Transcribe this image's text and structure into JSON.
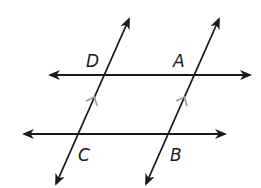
{
  "diagram": {
    "type": "parallel lines cut by parallel transversals",
    "colors": {
      "line": "#1a1a1a",
      "marker": "#9a9a9a",
      "background": "#ffffff"
    },
    "lines": [
      {
        "id": "upper-line",
        "x1": 50,
        "y1": 75,
        "x2": 250,
        "y2": 75,
        "arrows": "both"
      },
      {
        "id": "lower-line",
        "x1": 24,
        "y1": 134,
        "x2": 225,
        "y2": 134,
        "arrows": "both"
      },
      {
        "id": "left-transversal",
        "x1": 56,
        "y1": 184,
        "x2": 129,
        "y2": 19,
        "arrows": "both"
      },
      {
        "id": "right-transversal",
        "x1": 146,
        "y1": 184,
        "x2": 219,
        "y2": 19,
        "arrows": "both"
      }
    ],
    "points": [
      {
        "label": "D",
        "x": 86,
        "y": 67
      },
      {
        "label": "A",
        "x": 173,
        "y": 67
      },
      {
        "label": "C",
        "x": 78,
        "y": 161
      },
      {
        "label": "B",
        "x": 170,
        "y": 161
      }
    ],
    "parallel_markers": [
      {
        "on": "left-transversal",
        "x": 94,
        "y": 98
      },
      {
        "on": "right-transversal",
        "x": 184,
        "y": 98
      }
    ]
  }
}
